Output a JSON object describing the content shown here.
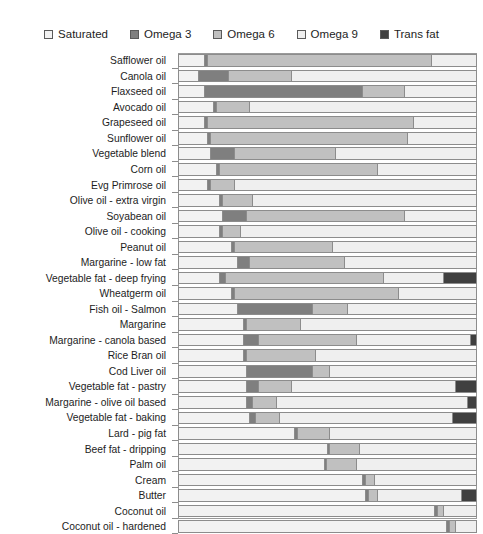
{
  "chart_title": "",
  "legend": {
    "position": "top-center",
    "items": [
      {
        "label": "Saturated",
        "color": "#f2f2f2",
        "icon": "square-swatch-icon"
      },
      {
        "label": "Omega 3",
        "color": "#7f7f7f",
        "icon": "square-swatch-icon"
      },
      {
        "label": "Omega 6",
        "color": "#c0c0c0",
        "icon": "square-swatch-icon"
      },
      {
        "label": "Omega 9",
        "color": "#efefef",
        "icon": "square-swatch-icon"
      },
      {
        "label": "Trans fat",
        "color": "#404040",
        "icon": "square-swatch-icon"
      }
    ]
  },
  "chart_data": {
    "type": "bar",
    "orientation": "horizontal",
    "stacked": true,
    "normalized": true,
    "title": "",
    "xlabel": "",
    "ylabel": "",
    "xlim": [
      0,
      100
    ],
    "grid": false,
    "legend_position": "top",
    "series": [
      {
        "name": "Saturated",
        "color": "#f2f2f2"
      },
      {
        "name": "Omega 3",
        "color": "#7f7f7f"
      },
      {
        "name": "Omega 6",
        "color": "#c0c0c0"
      },
      {
        "name": "Omega 9",
        "color": "#efefef"
      },
      {
        "name": "Trans fat",
        "color": "#404040"
      }
    ],
    "categories": [
      "Safflower oil",
      "Canola oil",
      "Flaxseed oil",
      "Avocado oil",
      "Grapeseed oil",
      "Sunflower oil",
      "Vegetable blend",
      "Corn oil",
      "Evg Primrose oil",
      "Olive oil - extra virgin",
      "Soyabean oil",
      "Olive oil - cooking",
      "Peanut oil",
      "Margarine - low fat",
      "Vegetable fat - deep frying",
      "Wheatgerm oil",
      "Fish oil - Salmon",
      "Margarine",
      "Margarine - canola based",
      "Rice Bran oil",
      "Cod Liver oil",
      "Vegetable fat - pastry",
      "Margarine - olive oil based",
      "Vegetable fat - baking",
      "Lard - pig fat",
      "Beef fat - dripping",
      "Palm oil",
      "Cream",
      "Butter",
      "Coconut oil",
      "Coconut oil - hardened"
    ],
    "values": {
      "Saturated": [
        9,
        7,
        9,
        12,
        9,
        10,
        11,
        13,
        10,
        14,
        15,
        14,
        18,
        20,
        14,
        18,
        20,
        22,
        22,
        22,
        23,
        23,
        23,
        24,
        39,
        50,
        49,
        62,
        63,
        86,
        90
      ],
      "Omega 3": [
        1,
        10,
        53,
        1,
        1,
        1,
        8,
        1,
        1,
        1,
        8,
        1,
        1,
        4,
        2,
        1,
        25,
        1,
        5,
        1,
        22,
        4,
        2,
        2,
        1,
        1,
        1,
        1,
        1,
        1,
        1
      ],
      "Omega 6": [
        75,
        21,
        14,
        11,
        69,
        66,
        34,
        53,
        8,
        10,
        53,
        6,
        33,
        32,
        53,
        55,
        12,
        18,
        33,
        23,
        6,
        11,
        8,
        8,
        11,
        10,
        10,
        3,
        3,
        2,
        2
      ],
      "Omega 9": [
        15,
        62,
        24,
        76,
        21,
        23,
        47,
        33,
        81,
        75,
        24,
        79,
        48,
        44,
        20,
        26,
        43,
        59,
        38,
        54,
        49,
        55,
        64,
        58,
        49,
        39,
        40,
        34,
        28,
        11,
        7
      ],
      "Trans fat": [
        0,
        0,
        0,
        0,
        0,
        0,
        0,
        0,
        0,
        0,
        0,
        0,
        0,
        0,
        11,
        0,
        0,
        0,
        2,
        0,
        0,
        7,
        3,
        8,
        0,
        0,
        0,
        0,
        5,
        0,
        0
      ]
    }
  }
}
